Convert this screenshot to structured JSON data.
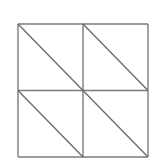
{
  "figure": {
    "background_color": "#ffffff",
    "line_color": "#7b7b7b",
    "diagonal_color": "#6e6e6e",
    "stroke_width": 1.4,
    "canvas": {
      "width": 161,
      "height": 166
    },
    "square": {
      "left": 18,
      "top": 24,
      "right": 148,
      "bottom": 157,
      "width": 130,
      "height": 133,
      "center_x": 83,
      "center_y": 90.5
    },
    "outline_edges": [
      {
        "name": "top-edge",
        "x1": 18,
        "y1": 24,
        "x2": 148,
        "y2": 24
      },
      {
        "name": "right-edge",
        "x1": 148,
        "y1": 24,
        "x2": 148,
        "y2": 157
      },
      {
        "name": "bottom-edge",
        "x1": 18,
        "y1": 157,
        "x2": 148,
        "y2": 157
      },
      {
        "name": "left-edge",
        "x1": 18,
        "y1": 24,
        "x2": 18,
        "y2": 157
      }
    ],
    "median_lines": [
      {
        "name": "vertical-median",
        "x1": 83,
        "y1": 24,
        "x2": 83,
        "y2": 157
      },
      {
        "name": "horizontal-median",
        "x1": 18,
        "y1": 90.5,
        "x2": 148,
        "y2": 90.5
      }
    ],
    "quadrants": [
      {
        "name": "top-left-quadrant",
        "diagonal_direction": "top-left-to-bottom-right",
        "diagonal": {
          "x1": 18,
          "y1": 24,
          "x2": 83,
          "y2": 90.5
        }
      },
      {
        "name": "top-right-quadrant",
        "diagonal_direction": "top-left-to-bottom-right",
        "diagonal": {
          "x1": 83,
          "y1": 24,
          "x2": 148,
          "y2": 90.5
        }
      },
      {
        "name": "bottom-left-quadrant",
        "diagonal_direction": "top-left-to-bottom-right",
        "diagonal": {
          "x1": 18,
          "y1": 90.5,
          "x2": 83,
          "y2": 157
        }
      },
      {
        "name": "bottom-right-quadrant",
        "diagonal_direction": "top-left-to-bottom-right",
        "diagonal": {
          "x1": 83,
          "y1": 90.5,
          "x2": 148,
          "y2": 157
        }
      }
    ],
    "counts": {
      "quadrants": 4,
      "diagonals": 4,
      "triangles": 8
    }
  }
}
